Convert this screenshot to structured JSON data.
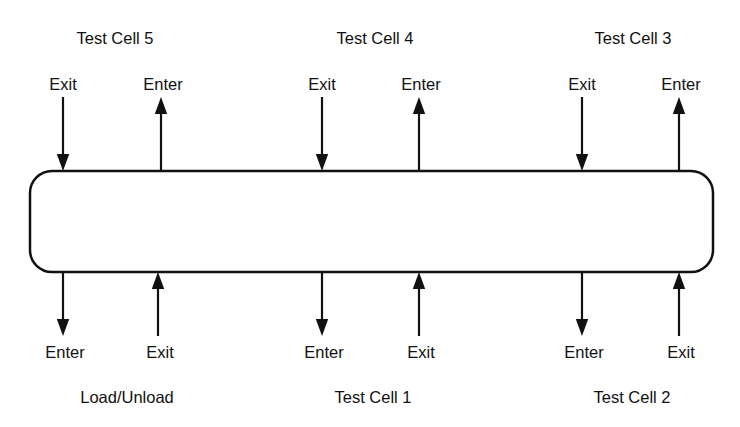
{
  "diagram": {
    "loop_track": {
      "shape": "rounded-rectangle",
      "x": 30,
      "y": 171,
      "width": 683,
      "height": 101,
      "corner_radius": 22,
      "stroke_color": "#111111",
      "stroke_width": 2.5,
      "fill_color": "#ffffff"
    },
    "arrow_color": "#111111",
    "arrow_stroke_width": 2.2,
    "top_arrow_tail_y": 97,
    "top_arrow_track_y": 171,
    "bottom_arrow_track_y": 272,
    "bottom_arrow_tail_y": 336,
    "stations": [
      {
        "id": "test-cell-5",
        "name": "Test Cell 5",
        "side": "top",
        "name_x": 115,
        "name_y": 38,
        "ports": [
          {
            "type": "exit",
            "label": "Exit",
            "direction": "down",
            "x": 63,
            "label_x": 63,
            "label_y": 84
          },
          {
            "type": "enter",
            "label": "Enter",
            "direction": "up",
            "x": 161,
            "label_x": 163,
            "label_y": 84
          }
        ]
      },
      {
        "id": "test-cell-4",
        "name": "Test Cell 4",
        "side": "top",
        "name_x": 375,
        "name_y": 38,
        "ports": [
          {
            "type": "exit",
            "label": "Exit",
            "direction": "down",
            "x": 322,
            "label_x": 322,
            "label_y": 84
          },
          {
            "type": "enter",
            "label": "Enter",
            "direction": "up",
            "x": 419,
            "label_x": 421,
            "label_y": 84
          }
        ]
      },
      {
        "id": "test-cell-3",
        "name": "Test Cell 3",
        "side": "top",
        "name_x": 633,
        "name_y": 38,
        "ports": [
          {
            "type": "exit",
            "label": "Exit",
            "direction": "down",
            "x": 582,
            "label_x": 582,
            "label_y": 84
          },
          {
            "type": "enter",
            "label": "Enter",
            "direction": "up",
            "x": 679,
            "label_x": 681,
            "label_y": 84
          }
        ]
      },
      {
        "id": "load-unload",
        "name": "Load/Unload",
        "side": "bottom",
        "name_x": 127,
        "name_y": 397,
        "ports": [
          {
            "type": "enter",
            "label": "Enter",
            "direction": "down",
            "x": 63,
            "label_x": 65,
            "label_y": 352
          },
          {
            "type": "exit",
            "label": "Exit",
            "direction": "up",
            "x": 158,
            "label_x": 160,
            "label_y": 352
          }
        ]
      },
      {
        "id": "test-cell-1",
        "name": "Test Cell 1",
        "side": "bottom",
        "name_x": 373,
        "name_y": 397,
        "ports": [
          {
            "type": "enter",
            "label": "Enter",
            "direction": "down",
            "x": 322,
            "label_x": 324,
            "label_y": 352
          },
          {
            "type": "exit",
            "label": "Exit",
            "direction": "up",
            "x": 419,
            "label_x": 421,
            "label_y": 352
          }
        ]
      },
      {
        "id": "test-cell-2",
        "name": "Test Cell 2",
        "side": "bottom",
        "name_x": 632,
        "name_y": 397,
        "ports": [
          {
            "type": "enter",
            "label": "Enter",
            "direction": "down",
            "x": 582,
            "label_x": 584,
            "label_y": 352
          },
          {
            "type": "exit",
            "label": "Exit",
            "direction": "up",
            "x": 679,
            "label_x": 681,
            "label_y": 352
          }
        ]
      }
    ]
  }
}
